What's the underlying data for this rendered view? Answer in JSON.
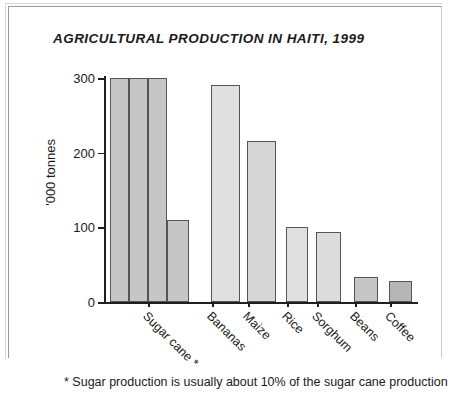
{
  "chart_data": {
    "type": "bar",
    "title": "AGRICULTURAL PRODUCTION IN HAITI, 1999",
    "xlabel": "",
    "ylabel": "'000 tonnes",
    "ylim": [
      0,
      300
    ],
    "yticks": [
      0,
      100,
      200,
      300
    ],
    "ytick_labels": [
      "0",
      "100",
      "200",
      "300"
    ],
    "grid": false,
    "legend": false,
    "categories": [
      "Sugar cane *",
      "Bananas",
      "Maize",
      "Rice",
      "Sorghum",
      "Beans",
      "Coffee"
    ],
    "values": [
      300,
      290,
      216,
      101,
      94,
      33,
      28
    ],
    "annotation": "* Sugar production is usually about 10% of the sugar cane production"
  },
  "title": "AGRICULTURAL PRODUCTION IN HAITI, 1999",
  "axis": {
    "y_label": "'000 tonnes",
    "y_ticks": [
      {
        "label": "300",
        "value": 300
      },
      {
        "label": "200",
        "value": 200
      },
      {
        "label": "100",
        "value": 100
      },
      {
        "label": "0",
        "value": 0
      }
    ]
  },
  "bars": [
    {
      "label": "Sugar cane *",
      "value": 300,
      "x": 6,
      "width": 19,
      "color": "#c6c6c6",
      "segment": true
    },
    {
      "label": "",
      "value": 300,
      "x": 25,
      "width": 19,
      "color": "#c6c6c6",
      "segment": true
    },
    {
      "label": "",
      "value": 300,
      "x": 44,
      "width": 19,
      "color": "#c6c6c6",
      "segment": true
    },
    {
      "label": "",
      "value": 110,
      "x": 63,
      "width": 22,
      "color": "#c6c6c6",
      "segment": false
    },
    {
      "label": "Bananas",
      "value": 290,
      "x": 107,
      "width": 29,
      "color": "#e0e0e0",
      "segment": false
    },
    {
      "label": "Maize",
      "value": 216,
      "x": 143,
      "width": 29,
      "color": "#d6d6d6",
      "segment": false
    },
    {
      "label": "Rice",
      "value": 101,
      "x": 182,
      "width": 22,
      "color": "#e0e0e0",
      "segment": false
    },
    {
      "label": "Sorghum",
      "value": 94,
      "x": 212,
      "width": 25,
      "color": "#dcdcdc",
      "segment": false
    },
    {
      "label": "Beans",
      "value": 33,
      "x": 250,
      "width": 24,
      "color": "#c6c6c6",
      "segment": false
    },
    {
      "label": "Coffee",
      "value": 28,
      "x": 285,
      "width": 23,
      "color": "#b6b6b6",
      "segment": false
    }
  ],
  "category_labels": [
    {
      "text": "Sugar cane *",
      "x": 46
    },
    {
      "text": "Bananas",
      "x": 110
    },
    {
      "text": "Maize",
      "x": 146
    },
    {
      "text": "Rice",
      "x": 185
    },
    {
      "text": "Sorghum",
      "x": 215
    },
    {
      "text": "Beans",
      "x": 253
    },
    {
      "text": "Coffee",
      "x": 288
    }
  ],
  "footnote": "* Sugar production is usually about 10% of the sugar cane production",
  "colors": {
    "axis": "#1f1f1f",
    "bar_outline": "#555555",
    "bar_light": "#e0e0e0",
    "bar_mid": "#c6c6c6",
    "bar_dark": "#b6b6b6",
    "text": "#1a1a1a",
    "frame": "#9a9a9a",
    "background": "#ffffff"
  }
}
